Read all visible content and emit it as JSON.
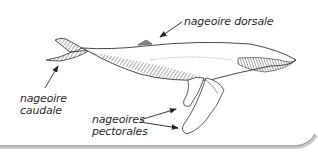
{
  "diagram": {
    "labels": {
      "dorsal": "nageoire dorsale",
      "caudal_line1": "nageoire",
      "caudal_line2": "caudale",
      "pectoral_line1": "nageoires",
      "pectoral_line2": "pectorales"
    },
    "colors": {
      "ink": "#2a2a2a",
      "hatch": "#555555",
      "frame_shadow": "#bdbdbd",
      "background": "#ffffff"
    }
  }
}
